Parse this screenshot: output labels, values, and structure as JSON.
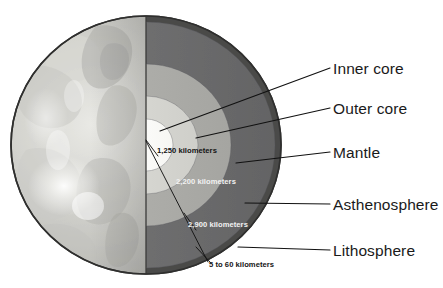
{
  "diagram": {
    "background_color": "#ffffff"
  },
  "layers": [
    {
      "key": "inner_core",
      "name": "Inner core",
      "color": "#fdfdfb"
    },
    {
      "key": "outer_core",
      "name": "Outer core",
      "color": "#d7d7d2"
    },
    {
      "key": "mantle",
      "name": "Mantle",
      "color": "#aeaeaa"
    },
    {
      "key": "asthenosphere",
      "name": "Asthenosphere",
      "color": "#6f6f6e"
    },
    {
      "key": "lithosphere",
      "name": "Lithosphere",
      "color": "#4a4a49"
    }
  ],
  "callouts": [
    {
      "key": "inner_core",
      "label": "Inner core"
    },
    {
      "key": "outer_core",
      "label": "Outer core"
    },
    {
      "key": "mantle",
      "label": "Mantle"
    },
    {
      "key": "asthenosphere",
      "label": "Asthenosphere"
    },
    {
      "key": "lithosphere",
      "label": "Lithosphere"
    }
  ],
  "depths": [
    {
      "key": "inner_core_depth",
      "label": "1,250 kilometers"
    },
    {
      "key": "outer_core_depth",
      "label": "2,200 kilometers"
    },
    {
      "key": "mantle_depth",
      "label": "2,900 kilometers"
    },
    {
      "key": "lithosphere_depth",
      "label": "5 to 60 kilometers"
    }
  ],
  "globe": {
    "surface_base_color": "#b9b9b5",
    "surface_light_color": "#e2e2de",
    "surface_highlight_color": "#fbfbf8",
    "surface_shadow_color": "#9b9b97",
    "crust_line_color": "#3b3b3a"
  }
}
